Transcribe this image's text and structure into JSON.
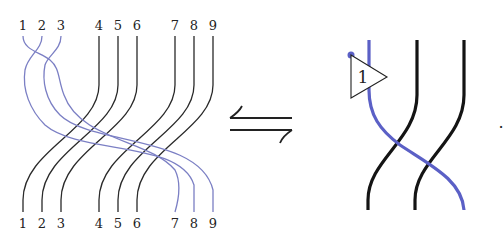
{
  "diagram": {
    "left_braid": {
      "top_labels": [
        "1",
        "2",
        "3",
        "4",
        "5",
        "6",
        "7",
        "8",
        "9"
      ],
      "bottom_labels": [
        "1",
        "2",
        "3",
        "4",
        "5",
        "6",
        "7",
        "8",
        "9"
      ],
      "strand_colors": {
        "black": "#2a2a2a",
        "blue": "#7b7fc4"
      },
      "description": "Blue strands 1,2,3 cross each other at top then pass over black strands 4-9 to end at positions 7,8,9"
    },
    "equivalence_symbol": "⇋",
    "right_braid": {
      "box_label": "1",
      "strand_colors": {
        "black": "#141414",
        "blue": "#5b60c6"
      }
    },
    "trailing_punctuation": "."
  }
}
